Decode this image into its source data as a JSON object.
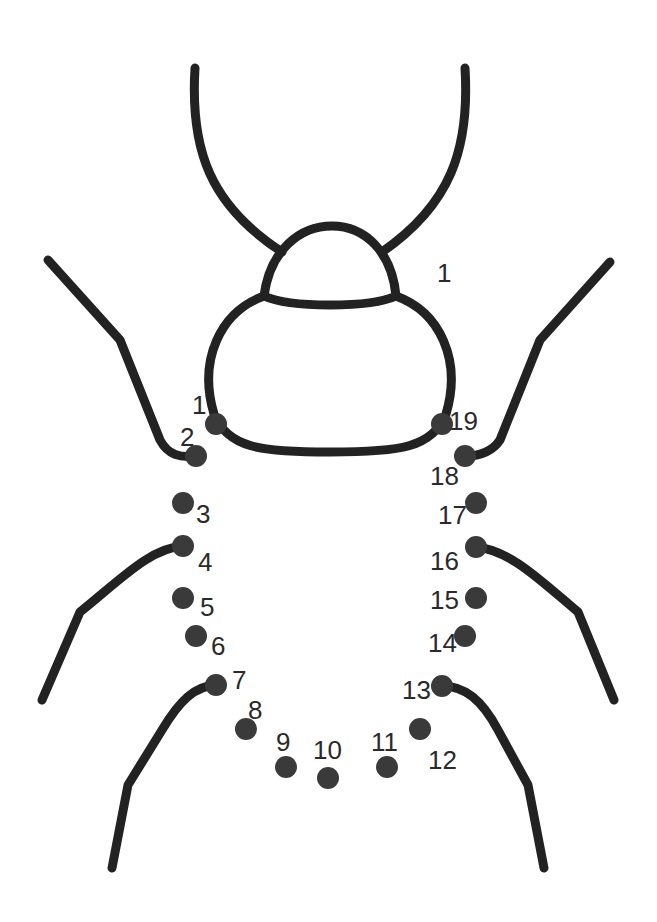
{
  "colors": {
    "line": "#222222",
    "dot": "#3a3a3a",
    "text": "#2a2a2a",
    "background": "#ffffff"
  },
  "stray_label": "1",
  "dots": [
    {
      "n": "1",
      "x": 216,
      "y": 424,
      "lx": 192,
      "ly": 405
    },
    {
      "n": "2",
      "x": 196,
      "y": 456,
      "lx": 180,
      "ly": 437
    },
    {
      "n": "3",
      "x": 183,
      "y": 503,
      "lx": 196,
      "ly": 514
    },
    {
      "n": "4",
      "x": 183,
      "y": 546,
      "lx": 198,
      "ly": 562
    },
    {
      "n": "5",
      "x": 183,
      "y": 598,
      "lx": 200,
      "ly": 607
    },
    {
      "n": "6",
      "x": 196,
      "y": 636,
      "lx": 211,
      "ly": 646
    },
    {
      "n": "7",
      "x": 216,
      "y": 685,
      "lx": 232,
      "ly": 680
    },
    {
      "n": "8",
      "x": 246,
      "y": 729,
      "lx": 248,
      "ly": 710
    },
    {
      "n": "9",
      "x": 286,
      "y": 767,
      "lx": 276,
      "ly": 742
    },
    {
      "n": "10",
      "x": 328,
      "y": 778,
      "lx": 313,
      "ly": 750
    },
    {
      "n": "11",
      "x": 387,
      "y": 767,
      "lx": 371,
      "ly": 742
    },
    {
      "n": "12",
      "x": 420,
      "y": 729,
      "lx": 428,
      "ly": 760
    },
    {
      "n": "13",
      "x": 442,
      "y": 686,
      "lx": 402,
      "ly": 690
    },
    {
      "n": "14",
      "x": 465,
      "y": 636,
      "lx": 428,
      "ly": 643
    },
    {
      "n": "15",
      "x": 476,
      "y": 598,
      "lx": 430,
      "ly": 600
    },
    {
      "n": "16",
      "x": 476,
      "y": 547,
      "lx": 430,
      "ly": 561
    },
    {
      "n": "17",
      "x": 476,
      "y": 503,
      "lx": 438,
      "ly": 515
    },
    {
      "n": "18",
      "x": 465,
      "y": 456,
      "lx": 430,
      "ly": 476
    },
    {
      "n": "19",
      "x": 442,
      "y": 424,
      "lx": 449,
      "ly": 421
    }
  ]
}
